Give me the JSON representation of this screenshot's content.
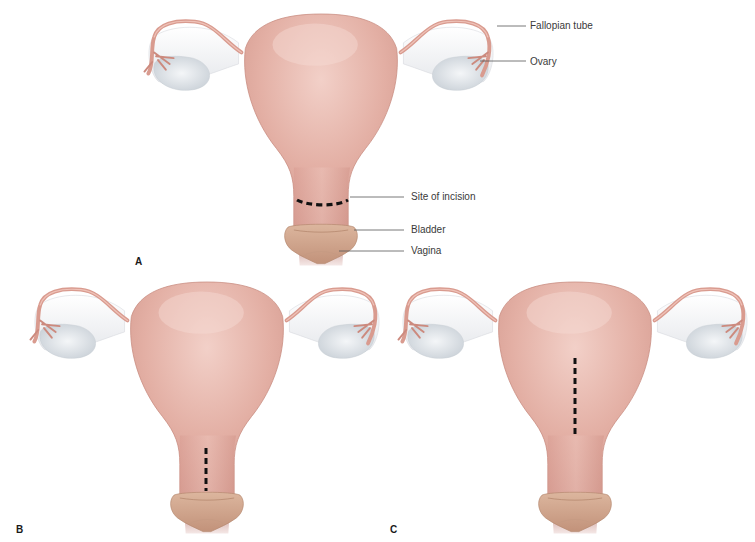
{
  "figure": {
    "panels": [
      {
        "id": "A",
        "letter": "A",
        "incision": "transverse",
        "incision_location": "lower uterine segment"
      },
      {
        "id": "B",
        "letter": "B",
        "incision": "low vertical",
        "incision_location": "lower uterine segment"
      },
      {
        "id": "C",
        "letter": "C",
        "incision": "classical vertical",
        "incision_location": "uterine body"
      }
    ],
    "labels": {
      "fallopian_tube": "Fallopian tube",
      "ovary": "Ovary",
      "site_of_incision": "Site of incision",
      "bladder": "Bladder",
      "vagina": "Vagina"
    },
    "colors": {
      "uterus": "#e3afa4",
      "uterus_highlight": "#f0cbc3",
      "uterus_shadow": "#c98c82",
      "tube": "#d99b8f",
      "ligament": "#f2f2f4",
      "ovary": "#e2e6ea",
      "bladder": "#cfa48a",
      "vagina": "#a8564f",
      "incision": "#111111",
      "leader_line": "#555555",
      "label_text": "#3a3a3a"
    }
  }
}
